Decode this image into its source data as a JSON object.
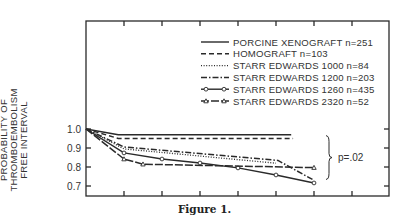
{
  "chart_data": {
    "type": "line",
    "title": "",
    "caption": "Figure 1.",
    "xlabel": "",
    "ylabel_lines": [
      "PROBABILITY OF",
      "THROMBOEMBOLISM",
      "FREE INTERVAL"
    ],
    "ylim": [
      0.65,
      1.0
    ],
    "y_ticks": [
      "1.0",
      "0.9",
      "0.8",
      "0.7"
    ],
    "y_tick_values": [
      1.0,
      0.9,
      0.8,
      0.7
    ],
    "x_range": [
      0,
      8
    ],
    "x_ticks": [
      1,
      2,
      3,
      4,
      5,
      6,
      7
    ],
    "x_tick_labels": [],
    "grid": false,
    "legend_position": "upper right",
    "series": [
      {
        "name": "PORCINE XENOGRAFT",
        "n": "n=251",
        "style": "solid",
        "marker": "none",
        "points": [
          [
            0,
            1.0
          ],
          [
            0.85,
            0.97
          ],
          [
            5.4,
            0.97
          ]
        ]
      },
      {
        "name": "HOMOGRAFT",
        "n": "n=103",
        "style": "dashed",
        "marker": "none",
        "points": [
          [
            0,
            1.0
          ],
          [
            0.85,
            0.95
          ],
          [
            5.45,
            0.95
          ]
        ]
      },
      {
        "name": "STARR EDWARDS 1000",
        "n": "n=84",
        "style": "dotted",
        "marker": "none",
        "points": [
          [
            0,
            1.0
          ],
          [
            1,
            0.895
          ],
          [
            5.0,
            0.82
          ]
        ]
      },
      {
        "name": "STARR EDWARDS 1200",
        "n": "n=203",
        "style": "dashdot",
        "marker": "none",
        "points": [
          [
            0,
            1.0
          ],
          [
            1,
            0.905
          ],
          [
            5.05,
            0.835
          ],
          [
            6.0,
            0.73
          ]
        ]
      },
      {
        "name": "STARR EDWARDS 1260",
        "n": "n=435",
        "style": "solid",
        "marker": "circle",
        "points": [
          [
            0,
            1.0
          ],
          [
            1,
            0.874
          ],
          [
            2,
            0.842
          ],
          [
            3,
            0.821
          ],
          [
            4,
            0.795
          ],
          [
            5,
            0.758
          ],
          [
            6,
            0.716
          ]
        ]
      },
      {
        "name": "STARR EDWARDS 2320",
        "n": "n=52",
        "style": "longdash",
        "marker": "triangle",
        "points": [
          [
            0,
            1.0
          ],
          [
            1,
            0.842
          ],
          [
            1.5,
            0.815
          ],
          [
            6.0,
            0.797
          ]
        ]
      }
    ],
    "annotations": [
      {
        "text": "p=.02",
        "type": "brace",
        "y_from": 0.97,
        "y_to": 0.74
      }
    ]
  }
}
